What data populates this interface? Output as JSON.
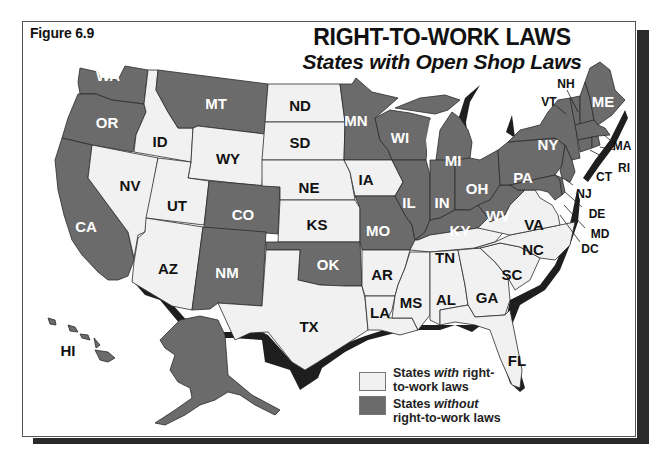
{
  "figure": {
    "label": "Figure 6.9",
    "title": "RIGHT-TO-WORK LAWS",
    "subtitle": "States with Open Shop Laws"
  },
  "colors": {
    "with_rtw": "#f1f1f1",
    "without_rtw": "#6b6b6b",
    "border": "#2b2b2b",
    "shadow": "#1e1e1e",
    "label_on_dark": "#ffffff",
    "label_on_light": "#111111"
  },
  "legend": {
    "items": [
      {
        "key": "with",
        "pre": "States ",
        "em": "with",
        "post": " right-to-work laws",
        "line1_pre": "States ",
        "line1_em": "with",
        "line1_post": " right-",
        "line2": "to-work laws",
        "color": "#f1f1f1"
      },
      {
        "key": "without",
        "pre": "States ",
        "em": "without",
        "post": " right-to-work laws",
        "line1_pre": "States ",
        "line1_em": "without",
        "line1_post": "",
        "line2": "right-to-work laws",
        "color": "#6b6b6b"
      }
    ]
  },
  "states": {
    "with_right_to_work": [
      "ID",
      "WY",
      "ND",
      "SD",
      "NE",
      "KS",
      "IA",
      "NV",
      "UT",
      "AZ",
      "TX",
      "AR",
      "LA",
      "MS",
      "AL",
      "GA",
      "FL",
      "TN",
      "SC",
      "NC",
      "VA"
    ],
    "without_right_to_work": [
      "WA",
      "OR",
      "CA",
      "MT",
      "CO",
      "NM",
      "OK",
      "MN",
      "WI",
      "MI",
      "IL",
      "IN",
      "OH",
      "KY",
      "WV",
      "MO",
      "PA",
      "NY",
      "NJ",
      "DE",
      "MD",
      "DC",
      "VT",
      "NH",
      "ME",
      "MA",
      "RI",
      "CT",
      "AK",
      "HI"
    ]
  },
  "labels": {
    "WA": "WA",
    "OR": "OR",
    "CA": "CA",
    "ID": "ID",
    "NV": "NV",
    "MT": "MT",
    "WY": "WY",
    "UT": "UT",
    "CO": "CO",
    "AZ": "AZ",
    "NM": "NM",
    "ND": "ND",
    "SD": "SD",
    "NE": "NE",
    "KS": "KS",
    "OK": "OK",
    "TX": "TX",
    "MN": "MN",
    "IA": "IA",
    "MO": "MO",
    "AR": "AR",
    "LA": "LA",
    "WI": "WI",
    "IL": "IL",
    "MI": "MI",
    "IN": "IN",
    "OH": "OH",
    "KY": "KY",
    "TN": "TN",
    "MS": "MS",
    "AL": "AL",
    "GA": "GA",
    "FL": "FL",
    "SC": "SC",
    "NC": "NC",
    "VA": "VA",
    "WV": "WV",
    "PA": "PA",
    "NY": "NY",
    "VT": "VT",
    "NH": "NH",
    "ME": "ME",
    "MA": "MA",
    "RI": "RI",
    "CT": "CT",
    "NJ": "NJ",
    "DE": "DE",
    "MD": "MD",
    "DC": "DC",
    "AK": "AK",
    "HI": "HI"
  }
}
